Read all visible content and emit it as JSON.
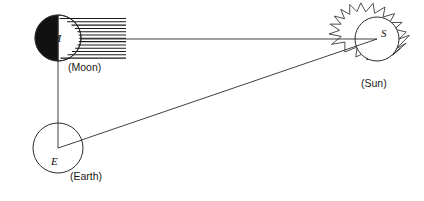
{
  "figure": {
    "background_color": "#ffffff",
    "width": 424,
    "height": 201
  },
  "bodies": {
    "moon": {
      "symbol": "M",
      "caption": "(Moon)",
      "center_x": 58,
      "center_y": 38,
      "radius": 23,
      "shading": "left-half-dark",
      "dark_color": "#111111",
      "light_color": "#ffffff",
      "outline_color": "#2b2b2b"
    },
    "earth": {
      "symbol": "E",
      "caption": "(Earth)",
      "center_x": 58,
      "center_y": 148,
      "radius": 25,
      "shading": "open",
      "fill_color": "#ffffff",
      "outline_color": "#2b2b2b"
    },
    "sun": {
      "symbol": "S",
      "caption": "(Sun)",
      "center_x": 377,
      "center_y": 39,
      "radius": 22,
      "ray_count": 16,
      "ray_length": 11,
      "fill_color": "#ffffff",
      "outline_color": "#3a3a3a"
    }
  },
  "hatching": {
    "description": "horizontal shading lines on sunlit side of Moon",
    "line_count": 13,
    "x_end": 126,
    "color": "#1a1a1a"
  },
  "sight_lines": [
    {
      "name": "moon-to-sun",
      "from": "moon",
      "to": "sun",
      "color": "#2b2b2b"
    },
    {
      "name": "moon-to-earth",
      "from": "moon",
      "to": "earth",
      "color": "#2b2b2b"
    },
    {
      "name": "earth-to-sun",
      "from": "earth",
      "to": "sun",
      "color": "#2b2b2b"
    }
  ]
}
